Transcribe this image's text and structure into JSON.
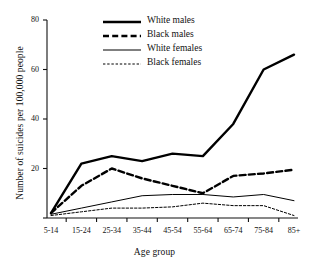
{
  "chart_data": {
    "type": "line",
    "title": "",
    "xlabel": "Age group",
    "ylabel": "Number of suicides per 100,000 people",
    "categories": [
      "5-14",
      "15-24",
      "25-34",
      "35-44",
      "45-54",
      "55-64",
      "65-74",
      "75-84",
      "85+"
    ],
    "ylim": [
      0,
      80
    ],
    "yticks": [
      0,
      20,
      40,
      60,
      80
    ],
    "ytick_labels": [
      "",
      "20",
      "40",
      "60",
      "80"
    ],
    "grid": false,
    "legend_position": "top-center",
    "series": [
      {
        "name": "White males",
        "style": "thick-solid",
        "color": "#000000",
        "values": [
          2,
          22,
          25,
          23,
          26,
          25,
          38,
          60,
          66
        ]
      },
      {
        "name": "Black males",
        "style": "thick-dashed",
        "color": "#000000",
        "values": [
          2,
          13,
          20,
          16,
          13,
          10,
          17,
          18,
          19.5
        ]
      },
      {
        "name": "White females",
        "style": "thin-solid",
        "color": "#000000",
        "values": [
          1.5,
          4,
          6.5,
          9,
          9.5,
          9.5,
          8.5,
          9.5,
          7
        ]
      },
      {
        "name": "Black females",
        "style": "thin-dotted",
        "color": "#000000",
        "values": [
          1,
          2.5,
          4,
          4,
          4.5,
          6,
          5,
          5,
          1
        ]
      }
    ]
  },
  "legend": {
    "items": [
      {
        "label": "White males"
      },
      {
        "label": "Black males"
      },
      {
        "label": "White females"
      },
      {
        "label": "Black females"
      }
    ]
  },
  "axes": {
    "y_title": "Number of suicides per 100,000 people",
    "x_title": "Age group"
  }
}
